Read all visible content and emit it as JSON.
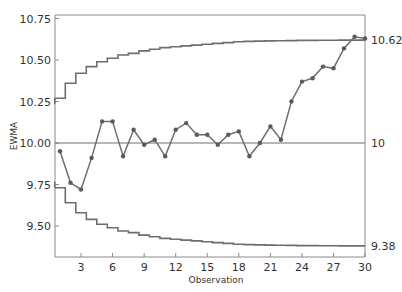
{
  "chart_data": {
    "type": "line",
    "title": "",
    "xlabel": "Observation",
    "ylabel": "EWMA",
    "xlim": [
      0.5,
      30
    ],
    "ylim": [
      9.32,
      10.78
    ],
    "x_ticks": [
      3,
      6,
      9,
      12,
      15,
      18,
      21,
      24,
      27,
      30
    ],
    "y_ticks": [
      "9.50",
      "9.75",
      "10.00",
      "10.25",
      "10.50",
      "10.75"
    ],
    "y_tick_values": [
      9.5,
      9.75,
      10.0,
      10.25,
      10.5,
      10.75
    ],
    "grid": false,
    "right_labels": {
      "ucl": "10.62",
      "center": "10",
      "lcl": "9.38"
    },
    "center_line": 10.0,
    "ucl_asymptote": 10.62,
    "lcl_asymptote": 9.38,
    "x": [
      1,
      2,
      3,
      4,
      5,
      6,
      7,
      8,
      9,
      10,
      11,
      12,
      13,
      14,
      15,
      16,
      17,
      18,
      19,
      20,
      21,
      22,
      23,
      24,
      25,
      26,
      27,
      28,
      29,
      30
    ],
    "series": [
      {
        "name": "EWMA",
        "values": [
          9.95,
          9.76,
          9.72,
          9.91,
          10.13,
          10.13,
          9.92,
          10.08,
          9.99,
          10.02,
          9.92,
          10.08,
          10.12,
          10.05,
          10.05,
          9.99,
          10.05,
          10.07,
          9.92,
          10.0,
          10.1,
          10.02,
          10.25,
          10.37,
          10.39,
          10.46,
          10.45,
          10.57,
          10.64,
          10.63
        ]
      },
      {
        "name": "UCL",
        "values": [
          10.27,
          10.36,
          10.42,
          10.46,
          10.49,
          10.51,
          10.53,
          10.54,
          10.555,
          10.565,
          10.575,
          10.58,
          10.585,
          10.59,
          10.595,
          10.6,
          10.605,
          10.61,
          10.612,
          10.614,
          10.615,
          10.616,
          10.617,
          10.618,
          10.618,
          10.619,
          10.619,
          10.62,
          10.62,
          10.62
        ]
      },
      {
        "name": "LCL",
        "values": [
          9.73,
          9.64,
          9.58,
          9.54,
          9.51,
          9.49,
          9.47,
          9.46,
          9.445,
          9.435,
          9.425,
          9.42,
          9.415,
          9.41,
          9.405,
          9.4,
          9.395,
          9.39,
          9.388,
          9.386,
          9.385,
          9.384,
          9.383,
          9.382,
          9.382,
          9.381,
          9.381,
          9.38,
          9.38,
          9.38
        ]
      }
    ]
  },
  "colors": {
    "line": "#6e6e6e",
    "marker": "#5a5a5a",
    "axis": "#8a8a8a",
    "text": "#333333"
  }
}
